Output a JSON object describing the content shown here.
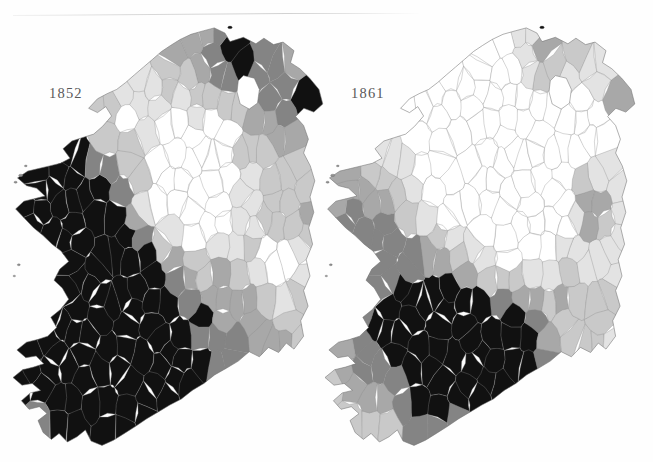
{
  "page": {
    "running_head": "",
    "has_horizontal_rule": true,
    "background_color": "#fefefe"
  },
  "chart_data": {
    "type": "map",
    "subtype": "choropleth",
    "title": "",
    "region": "Ireland",
    "unit_of_observation": "Poor Law Union / district",
    "small_multiples": true,
    "panel_labels": [
      "1852",
      "1861"
    ],
    "legend": {
      "present": false,
      "position": "none"
    },
    "grid": false,
    "shading": {
      "scheme": "grayscale",
      "n_classes": 6,
      "direction": "white = lowest value, black = highest value",
      "class_colors": [
        "#ffffff",
        "#e3e3e3",
        "#c9c9c9",
        "#a8a8a8",
        "#848484",
        "#111111"
      ]
    },
    "panels": [
      {
        "label": "1852",
        "summary": "Dark (highest) shading dominates the west, south-west and south; the midlands and parts of the north-east are light.",
        "class_counts": [
          14,
          22,
          26,
          34,
          38,
          69
        ],
        "regions": [
          {
            "name": "Donegal (north-west)",
            "class": 1
          },
          {
            "name": "Antrim / Belfast",
            "class": 5
          },
          {
            "name": "Londonderry",
            "class": 4
          },
          {
            "name": "Down",
            "class": 3
          },
          {
            "name": "Tyrone",
            "class": 3
          },
          {
            "name": "Fermanagh",
            "class": 3
          },
          {
            "name": "Armagh",
            "class": 2
          },
          {
            "name": "Monaghan",
            "class": 3
          },
          {
            "name": "Cavan",
            "class": 2
          },
          {
            "name": "Sligo",
            "class": 4
          },
          {
            "name": "Leitrim",
            "class": 3
          },
          {
            "name": "Mayo",
            "class": 5
          },
          {
            "name": "Roscommon",
            "class": 4
          },
          {
            "name": "Galway",
            "class": 5
          },
          {
            "name": "Clare",
            "class": 5
          },
          {
            "name": "Limerick",
            "class": 5
          },
          {
            "name": "Kerry",
            "class": 5
          },
          {
            "name": "Cork",
            "class": 5
          },
          {
            "name": "Tipperary",
            "class": 4
          },
          {
            "name": "Waterford",
            "class": 4
          },
          {
            "name": "Kilkenny",
            "class": 3
          },
          {
            "name": "Wexford",
            "class": 2
          },
          {
            "name": "Wicklow",
            "class": 0
          },
          {
            "name": "Dublin",
            "class": 1
          },
          {
            "name": "Kildare",
            "class": 1
          },
          {
            "name": "Meath",
            "class": 0
          },
          {
            "name": "Westmeath",
            "class": 0
          },
          {
            "name": "Offaly (King's)",
            "class": 1
          },
          {
            "name": "Laois (Queen's)",
            "class": 2
          },
          {
            "name": "Longford",
            "class": 0
          },
          {
            "name": "Louth",
            "class": 2
          }
        ]
      },
      {
        "label": "1861",
        "summary": "Overall much lighter than 1852; the north and midlands are predominantly white to light grey, with the darkest shading confined to the south, south-west and a small area around Belfast.",
        "class_counts": [
          44,
          38,
          34,
          30,
          24,
          33
        ],
        "regions": [
          {
            "name": "Donegal (north-west)",
            "class": 0
          },
          {
            "name": "Antrim / Belfast",
            "class": 5
          },
          {
            "name": "Londonderry",
            "class": 1
          },
          {
            "name": "Down",
            "class": 1
          },
          {
            "name": "Tyrone",
            "class": 0
          },
          {
            "name": "Fermanagh",
            "class": 1
          },
          {
            "name": "Armagh",
            "class": 1
          },
          {
            "name": "Monaghan",
            "class": 1
          },
          {
            "name": "Cavan",
            "class": 0
          },
          {
            "name": "Sligo",
            "class": 3
          },
          {
            "name": "Leitrim",
            "class": 1
          },
          {
            "name": "Mayo",
            "class": 4
          },
          {
            "name": "Roscommon",
            "class": 2
          },
          {
            "name": "Galway",
            "class": 4
          },
          {
            "name": "Clare",
            "class": 3
          },
          {
            "name": "Limerick",
            "class": 3
          },
          {
            "name": "Kerry",
            "class": 3
          },
          {
            "name": "Cork",
            "class": 5
          },
          {
            "name": "Tipperary",
            "class": 4
          },
          {
            "name": "Waterford",
            "class": 5
          },
          {
            "name": "Kilkenny",
            "class": 3
          },
          {
            "name": "Wexford",
            "class": 2
          },
          {
            "name": "Wicklow",
            "class": 0
          },
          {
            "name": "Dublin",
            "class": 5
          },
          {
            "name": "Kildare",
            "class": 1
          },
          {
            "name": "Meath",
            "class": 0
          },
          {
            "name": "Westmeath",
            "class": 0
          },
          {
            "name": "Offaly (King's)",
            "class": 1
          },
          {
            "name": "Laois (Queen's)",
            "class": 2
          },
          {
            "name": "Longford",
            "class": 0
          },
          {
            "name": "Louth",
            "class": 1
          }
        ]
      }
    ]
  }
}
